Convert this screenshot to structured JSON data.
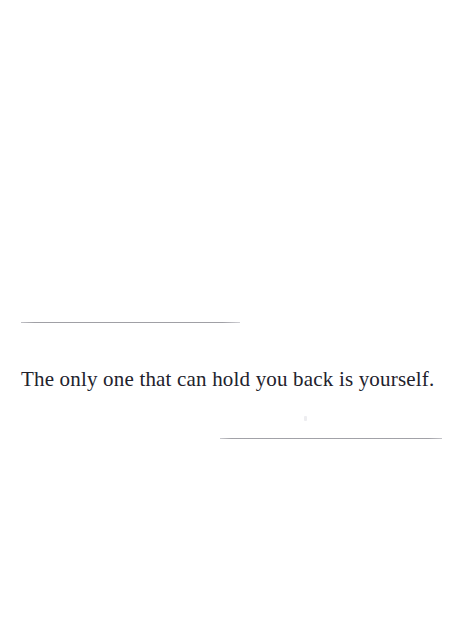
{
  "page": {
    "background_color": "#ffffff",
    "width": 460,
    "height": 634
  },
  "content": {
    "quote_text": "The only one that can hold you back is yourself.",
    "text_color": "#22222c"
  },
  "decoration": {
    "top_rule": {
      "name": "top-divider-rule",
      "color": "#9b9ba1"
    },
    "bottom_rule": {
      "name": "bottom-divider-rule",
      "color": "#9d9da3"
    },
    "speck": {
      "name": "scan-artifact-speck",
      "color": "#ededf0"
    }
  }
}
